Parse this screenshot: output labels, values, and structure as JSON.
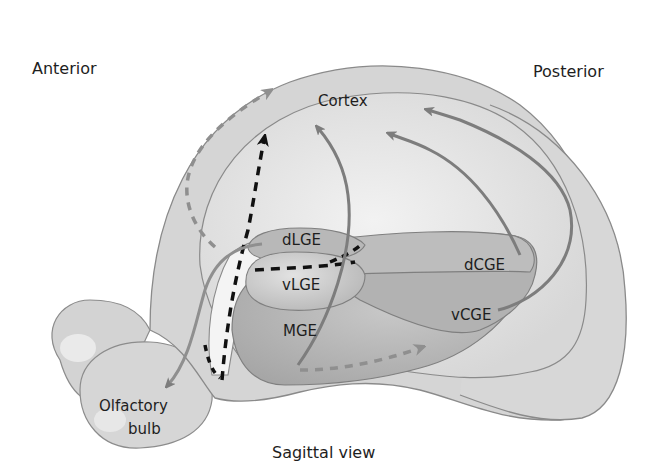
{
  "diagram": {
    "type": "anatomical-diagram",
    "view": "Sagittal view",
    "orientation": {
      "anterior": "Anterior",
      "posterior": "Posterior"
    },
    "regions": {
      "cortex": "Cortex",
      "dlge": "dLGE",
      "vlge": "vLGE",
      "mge": "MGE",
      "dcge": "dCGE",
      "vcge": "vCGE",
      "olfactory_bulb_line1": "Olfactory",
      "olfactory_bulb_line2": "bulb"
    },
    "arrows": [
      {
        "from": "dLGE",
        "to": "Cortex (anterior)",
        "style": "dashed",
        "color": "#8a8a8a"
      },
      {
        "from": "LGE",
        "to": "Cortex",
        "style": "dashed",
        "color": "#111111"
      },
      {
        "from": "MGE",
        "to": "Cortex",
        "style": "solid",
        "color": "#7a7a7a"
      },
      {
        "from": "CGE",
        "to": "Cortex (posterior)",
        "style": "solid",
        "color": "#7a7a7a"
      },
      {
        "from": "vCGE",
        "to": "Cortex (posterior)",
        "style": "solid",
        "color": "#7a7a7a"
      },
      {
        "from": "MGE",
        "to": "vCGE",
        "style": "dashed",
        "color": "#8a8a8a"
      },
      {
        "from": "LGE",
        "to": "Olfactory bulb",
        "style": "solid",
        "color": "#8a8a8a"
      }
    ],
    "colors": {
      "brain_outer": "#d6d6d6",
      "cortex_inner": "#e2e2e2",
      "eminence_light": "#bdbdbd",
      "eminence_dark": "#a9a9a9",
      "outline": "#8c8c8c",
      "arrow_grey": "#7d7d7d",
      "arrow_black": "#111111"
    }
  }
}
